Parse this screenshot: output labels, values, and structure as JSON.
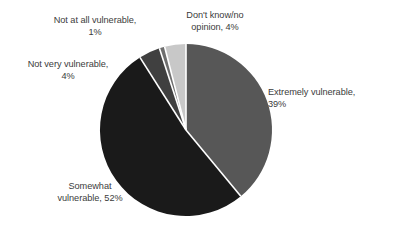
{
  "chart_data": {
    "type": "pie",
    "title": "",
    "subtitle": "",
    "xlabel": "",
    "ylabel": "",
    "legend_position": "none",
    "grid": false,
    "labels_outside": true,
    "start_angle_deg": 0,
    "direction": "clockwise",
    "categories": [
      "Extremely vulnerable",
      "Somewhat vulnerable",
      "Not very vulnerable",
      "Not at all vulnerable",
      "Don't know/no opinion"
    ],
    "values": [
      39,
      52,
      4,
      1,
      4
    ],
    "value_unit": "%",
    "colors": [
      "#575757",
      "#1a1a1a",
      "#404040",
      "#6e6e6e",
      "#c8c8c8"
    ],
    "slices": [
      {
        "name": "Extremely vulnerable",
        "value": 39,
        "label": "Extremely vulnerable,\n39%",
        "color": "#575757",
        "start_deg": 0,
        "end_deg": 140.4
      },
      {
        "name": "Somewhat vulnerable",
        "value": 52,
        "label": "Somewhat\nvulnerable, 52%",
        "color": "#1a1a1a",
        "start_deg": 140.4,
        "end_deg": 327.6
      },
      {
        "name": "Not very vulnerable",
        "value": 4,
        "label": "Not very vulnerable,\n4%",
        "color": "#404040",
        "start_deg": 327.6,
        "end_deg": 342.0
      },
      {
        "name": "Not at all vulnerable",
        "value": 1,
        "label": "Not at all vulnerable,\n1%",
        "color": "#6e6e6e",
        "start_deg": 342.0,
        "end_deg": 345.6
      },
      {
        "name": "Don't know/no opinion",
        "value": 4,
        "label": "Don't know/no\nopinion, 4%",
        "color": "#c8c8c8",
        "start_deg": 345.6,
        "end_deg": 360.0
      }
    ]
  },
  "geometry": {
    "center_x": 186,
    "center_y": 130,
    "radius": 86,
    "separator_color": "#ffffff",
    "separator_width": 1.6
  },
  "canvas": {
    "background": "#ffffff",
    "text_color": "#3b3b3b"
  }
}
